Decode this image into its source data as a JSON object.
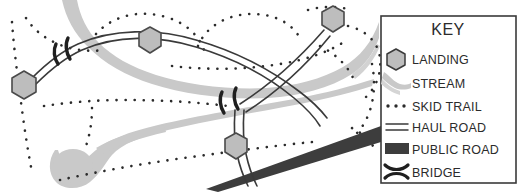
{
  "figure": {
    "type": "map"
  },
  "legend": {
    "title": "KEY",
    "box": {
      "x": 381,
      "y": 16,
      "width": 135,
      "height": 167,
      "border_color": "#3a3a3a",
      "fill_color": "#ffffff"
    },
    "items": [
      {
        "label": "LANDING",
        "symbol": "hexagon",
        "icon_name": "landing-hexagon-icon",
        "fill_color": "#bdbdbd",
        "stroke_color": "#3a3a3a"
      },
      {
        "label": "STREAM",
        "symbol": "grey-band",
        "icon_name": "stream-band-icon",
        "fill_color": "#c9c9c9",
        "stroke_color": "none"
      },
      {
        "label": "SKID TRAIL",
        "symbol": "dotted-line",
        "icon_name": "skid-trail-dots-icon",
        "fill_color": "#2b2b2b",
        "stroke_color": "#2b2b2b"
      },
      {
        "label": "HAUL ROAD",
        "symbol": "double-line",
        "icon_name": "haul-road-double-line-icon",
        "fill_color": "none",
        "stroke_color": "#3a3a3a"
      },
      {
        "label": "PUBLIC ROAD",
        "symbol": "solid-bar",
        "icon_name": "public-road-bar-icon",
        "fill_color": "#3d3d3d",
        "stroke_color": "#3d3d3d"
      },
      {
        "label": "BRIDGE",
        "symbol": "bridge-marks",
        "icon_name": "bridge-icon",
        "fill_color": "none",
        "stroke_color": "#1f1f1f"
      }
    ]
  },
  "map": {
    "colors": {
      "stream": "#c9c9c9",
      "landing_fill": "#bdbdbd",
      "landing_stroke": "#4a4a4a",
      "haul_road": "#3a3a3a",
      "skid_trail": "#2b2b2b",
      "public_road": "#3d3d3d",
      "bridge": "#1f1f1f",
      "background": "#ffffff"
    },
    "landings": [
      {
        "name": "landing-west",
        "cx": 24,
        "cy": 85,
        "r": 14
      },
      {
        "name": "landing-north-center",
        "cx": 150,
        "cy": 40,
        "r": 13
      },
      {
        "name": "landing-northeast",
        "cx": 333,
        "cy": 19,
        "r": 13
      },
      {
        "name": "landing-south-center",
        "cx": 236,
        "cy": 146,
        "r": 13
      }
    ],
    "bridges": [
      {
        "name": "bridge-west",
        "x": 62,
        "y": 52,
        "angle": -28
      },
      {
        "name": "bridge-center",
        "x": 228,
        "y": 101,
        "angle": -24
      }
    ],
    "streams": [
      {
        "name": "stream-north",
        "description": "Stream entering from top edge near x=70, curving south-east across the map."
      },
      {
        "name": "stream-south",
        "description": "Stream with bulbous pond head at lower left, tapering east-north-east."
      }
    ],
    "haul_roads": [
      {
        "name": "haul-road-main",
        "description": "Arcing double-line road from west landing, over the center, to the northeast landing."
      },
      {
        "name": "haul-road-spur",
        "description": "Double-line spur branching south from the junction down to the public road."
      }
    ],
    "public_road": {
      "name": "public-road-diagonal",
      "description": "Solid dark tapered band running from lower-left to the right edge at the legend box."
    },
    "skid_trails": {
      "name": "skid-trail-network",
      "description": "Dotted lines forming loops and branches across the harvest unit."
    }
  }
}
